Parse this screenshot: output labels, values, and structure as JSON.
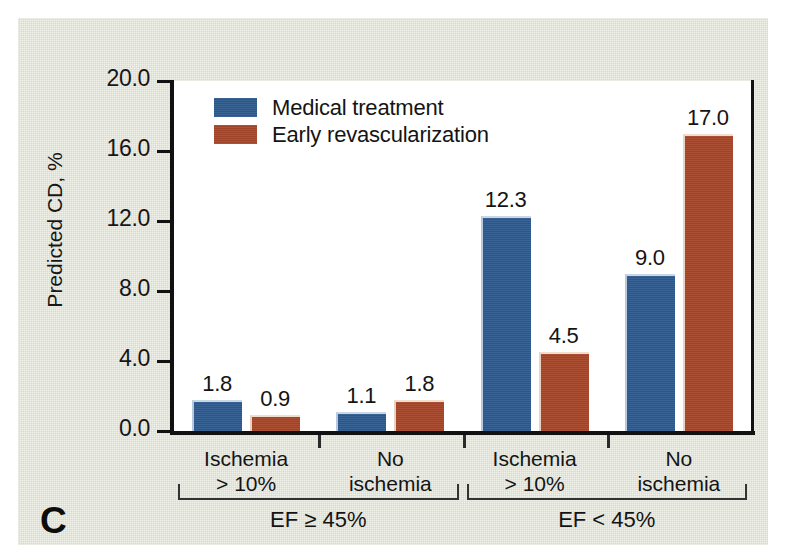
{
  "panel": {
    "letter": "C"
  },
  "chart_data": {
    "type": "bar",
    "title": "",
    "subtitle": "",
    "xlabel": "",
    "ylabel": "Predicted CD, %",
    "ylim": [
      0,
      20
    ],
    "yticks": [
      "0.0",
      "4.0",
      "8.0",
      "12.0",
      "16.0",
      "20.0"
    ],
    "ytick_values": [
      0,
      4,
      8,
      12,
      16,
      20
    ],
    "grid": false,
    "legend_position": "top-left",
    "categories": [
      "Ischemia > 10%",
      "No ischemia",
      "Ischemia > 10%",
      "No ischemia"
    ],
    "category_lines": [
      [
        "Ischemia",
        "> 10%"
      ],
      [
        "No",
        "ischemia"
      ],
      [
        "Ischemia",
        "> 10%"
      ],
      [
        "No",
        "ischemia"
      ]
    ],
    "series": [
      {
        "name": "Medical treatment",
        "color": "#2d5b8e",
        "values": [
          1.8,
          1.1,
          12.3,
          9.0
        ],
        "labels": [
          "1.8",
          "1.1",
          "12.3",
          "9.0"
        ]
      },
      {
        "name": "Early revascularization",
        "color": "#a8472a",
        "values": [
          0.9,
          1.8,
          4.5,
          17.0
        ],
        "labels": [
          "0.9",
          "1.8",
          "4.5",
          "17.0"
        ]
      }
    ],
    "groups": [
      {
        "label": "EF ≥ 45%",
        "categories": [
          0,
          1
        ]
      },
      {
        "label": "EF < 45%",
        "categories": [
          2,
          3
        ]
      }
    ]
  },
  "legend": {
    "items": [
      {
        "label": "Medical treatment",
        "color": "#2d5b8e"
      },
      {
        "label": "Early revascularization",
        "color": "#a8472a"
      }
    ]
  },
  "axis": {
    "y_title": "Predicted CD, %",
    "y_labels": [
      "20.0",
      "16.0",
      "12.0",
      "8.0",
      "4.0",
      "0.0"
    ]
  },
  "colors": {
    "background": "#dde2d1",
    "plot_background": "#ffffff",
    "axis": "#111111",
    "medical": "#2d5b8e",
    "revascularization": "#a8472a"
  }
}
